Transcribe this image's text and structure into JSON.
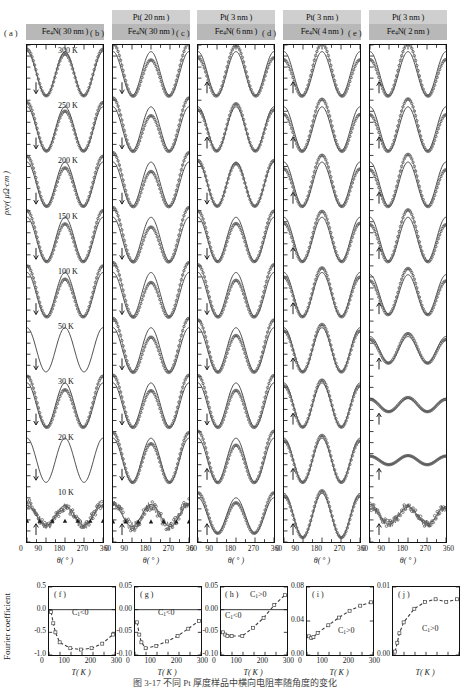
{
  "figure": {
    "caption": "图 3-17   不同 Pt 厚度样品中横向电阻率随角度的变化",
    "y_axis_main": "ρxy( μΩ·cm )",
    "y_axis_bottom": "Fourier coefficient",
    "x_axis_main": "θ( ° )",
    "x_axis_bottom": "T( K )"
  },
  "top_panels": [
    {
      "letter": "( a )",
      "pt_layer": "",
      "fe_layer": "Fe4N( 30 nm )",
      "xticks": [
        "0",
        "90",
        "180",
        "270",
        "360"
      ],
      "arrows": [
        "down",
        "down",
        "down",
        "down",
        "down",
        "down",
        "down",
        "down",
        "up"
      ]
    },
    {
      "letter": "( b )",
      "pt_layer": "Pt( 20 nm )",
      "fe_layer": "Fe4N( 30 nm )",
      "xticks": [
        "0",
        "90",
        "180",
        "270",
        "360"
      ],
      "arrows": [
        "down",
        "down",
        "down",
        "down",
        "down",
        "down",
        "down",
        "down",
        "up"
      ]
    },
    {
      "letter": "( c )",
      "pt_layer": "Pt( 3 nm )",
      "fe_layer": "Fe4N( 6 nm )",
      "xticks": [
        "0",
        "90",
        "180",
        "270",
        "360"
      ],
      "arrows": [
        "up",
        "up",
        "down",
        "down",
        "down",
        "down",
        "down",
        "up",
        "up"
      ]
    },
    {
      "letter": "( d )",
      "pt_layer": "Pt( 3 nm )",
      "fe_layer": "Fe4N( 4 nm )",
      "xticks": [
        "0",
        "90",
        "180",
        "270",
        "360"
      ],
      "arrows": [
        "up",
        "up",
        "up",
        "up",
        "up",
        "up",
        "up",
        "up",
        "up"
      ]
    },
    {
      "letter": "( e )",
      "pt_layer": "Pt( 3 nm )",
      "fe_layer": "Fe4N( 2 nm )",
      "xticks": [
        "0",
        "90",
        "180",
        "270",
        "360"
      ],
      "arrows": [
        "up",
        "up",
        "up",
        "up",
        "up",
        "up",
        "up",
        "up",
        "up"
      ]
    }
  ],
  "temperatures": [
    "300 K",
    "250 K",
    "200 K",
    "150 K",
    "100 K",
    "50 K",
    "30 K",
    "20 K",
    "10 K"
  ],
  "bottom_panels": [
    {
      "letter": "( f )",
      "sign_labels": [
        "C1<0"
      ],
      "yticks": [
        "0.5",
        "0.0",
        "-0.5",
        "-1.0"
      ],
      "xticks": [
        "0",
        "100",
        "200",
        "300"
      ]
    },
    {
      "letter": "( g )",
      "sign_labels": [
        "C1<0"
      ],
      "yticks": [
        "0.05",
        "0.00",
        "-0.05",
        "-0.10"
      ],
      "xticks": [
        "0",
        "100",
        "200",
        "300"
      ]
    },
    {
      "letter": "( h )",
      "sign_labels": [
        "C1>0",
        "C1<0"
      ],
      "yticks": [
        "0.05",
        "0.00",
        "-0.05",
        "-0.10"
      ],
      "xticks": [
        "0",
        "100",
        "200",
        "300"
      ]
    },
    {
      "letter": "( i )",
      "sign_labels": [
        "C1>0"
      ],
      "yticks": [
        "0.08",
        "0.04",
        "0.00"
      ],
      "xticks": [
        "0",
        "100",
        "200",
        "300"
      ]
    },
    {
      "letter": "( j )",
      "sign_labels": [
        "C1>0"
      ],
      "yticks": [
        "0.01",
        "0.00"
      ],
      "xticks": [
        "",
        "",
        "",
        ""
      ]
    }
  ],
  "chart_data": {
    "type": "line",
    "xlabel": "θ( ° )",
    "ylabel": "ρxy( μΩ·cm )",
    "xlim": [
      0,
      360
    ],
    "grid": false,
    "legend": "none",
    "panels": [
      {
        "id": "a",
        "stack": "Fe4N( 30 nm )",
        "curves": [
          {
            "T": "300 K",
            "amp": 1.0,
            "phase": 0,
            "c1": -0.3,
            "style": "open-circles+line"
          },
          {
            "T": "250 K",
            "amp": 1.0,
            "phase": 0,
            "c1": -0.55,
            "style": "open-circles+line"
          },
          {
            "T": "200 K",
            "amp": 1.0,
            "phase": 0,
            "c1": -0.75,
            "style": "open-circles+line"
          },
          {
            "T": "150 K",
            "amp": 1.0,
            "phase": 0,
            "c1": -0.85,
            "style": "open-circles+line"
          },
          {
            "T": "100 K",
            "amp": 1.0,
            "phase": 0,
            "c1": -0.85,
            "style": "open-circles+line"
          },
          {
            "T": "50 K",
            "amp": 1.0,
            "phase": 0,
            "c1": -0.88,
            "style": "line"
          },
          {
            "T": "30 K",
            "amp": 1.0,
            "phase": 0,
            "c1": -0.88,
            "style": "open-circles+line"
          },
          {
            "T": "20 K",
            "amp": 1.0,
            "phase": 0,
            "c1": -0.85,
            "style": "line"
          },
          {
            "T": "10 K",
            "amp": 0.45,
            "phase": 0,
            "c1": -0.6,
            "style": "triangles+circles"
          }
        ]
      },
      {
        "id": "b",
        "stack": "Pt( 20 nm ) / Fe4N( 30 nm )",
        "curves": [
          {
            "T": "300 K",
            "amp": 1.0,
            "phase": 0,
            "c1": -0.075,
            "style": "open-circles+line"
          },
          {
            "T": "250 K",
            "amp": 1.0,
            "phase": 0,
            "c1": -0.08,
            "style": "open-circles+line"
          },
          {
            "T": "200 K",
            "amp": 1.0,
            "phase": 0,
            "c1": -0.085,
            "style": "open-circles+line"
          },
          {
            "T": "150 K",
            "amp": 1.0,
            "phase": 0,
            "c1": -0.088,
            "style": "open-circles+line"
          },
          {
            "T": "100 K",
            "amp": 1.0,
            "phase": 0,
            "c1": -0.09,
            "style": "open-circles+line"
          },
          {
            "T": "50 K",
            "amp": 1.0,
            "phase": 0,
            "c1": -0.085,
            "style": "open-circles+line"
          },
          {
            "T": "30 K",
            "amp": 1.0,
            "phase": 0,
            "c1": -0.07,
            "style": "open-circles+line"
          },
          {
            "T": "20 K",
            "amp": 1.0,
            "phase": 0,
            "c1": -0.05,
            "style": "open-circles+line"
          },
          {
            "T": "10 K",
            "amp": 0.5,
            "phase": 0,
            "c1": -0.03,
            "style": "triangles+circles"
          }
        ]
      },
      {
        "id": "c",
        "stack": "Pt( 3 nm ) / Fe4N( 6 nm )",
        "curves": [
          {
            "T": "300 K",
            "amp": 1.0,
            "phase": 0,
            "c1": 0.04,
            "style": "open-circles+line"
          },
          {
            "T": "250 K",
            "amp": 1.0,
            "phase": 0,
            "c1": 0.02,
            "style": "open-circles+line"
          },
          {
            "T": "200 K",
            "amp": 1.0,
            "phase": 0,
            "c1": -0.01,
            "style": "open-circles+line"
          },
          {
            "T": "150 K",
            "amp": 1.0,
            "phase": 0,
            "c1": -0.04,
            "style": "open-circles+line"
          },
          {
            "T": "100 K",
            "amp": 1.0,
            "phase": 0,
            "c1": -0.05,
            "style": "open-circles+line"
          },
          {
            "T": "50 K",
            "amp": 1.0,
            "phase": 0,
            "c1": -0.05,
            "style": "open-circles+line"
          },
          {
            "T": "30 K",
            "amp": 1.0,
            "phase": 0,
            "c1": -0.048,
            "style": "open-circles+line"
          },
          {
            "T": "20 K",
            "amp": 1.0,
            "phase": 0,
            "c1": -0.045,
            "style": "open-circles+line"
          },
          {
            "T": "10 K",
            "amp": 0.8,
            "phase": 0,
            "c1": -0.04,
            "style": "open-circles+line"
          }
        ]
      },
      {
        "id": "d",
        "stack": "Pt( 3 nm ) / Fe4N( 4 nm )",
        "curves": [
          {
            "T": "300 K",
            "amp": 1.0,
            "phase": 0,
            "c1": 0.062,
            "style": "open-circles+line"
          },
          {
            "T": "250 K",
            "amp": 1.0,
            "phase": 0,
            "c1": 0.058,
            "style": "open-circles+line"
          },
          {
            "T": "200 K",
            "amp": 1.0,
            "phase": 0,
            "c1": 0.052,
            "style": "open-circles+line"
          },
          {
            "T": "150 K",
            "amp": 1.0,
            "phase": 0,
            "c1": 0.045,
            "style": "open-circles+line"
          },
          {
            "T": "100 K",
            "amp": 1.0,
            "phase": 0,
            "c1": 0.035,
            "style": "open-circles+line"
          },
          {
            "T": "50 K",
            "amp": 1.0,
            "phase": 0,
            "c1": 0.025,
            "style": "open-circles+line"
          },
          {
            "T": "30 K",
            "amp": 1.0,
            "phase": 0,
            "c1": 0.022,
            "style": "open-circles+line"
          },
          {
            "T": "20 K",
            "amp": 1.0,
            "phase": 0,
            "c1": 0.021,
            "style": "open-circles+line"
          },
          {
            "T": "10 K",
            "amp": 1.0,
            "phase": 0,
            "c1": 0.02,
            "style": "open-circles+line"
          }
        ]
      },
      {
        "id": "e",
        "stack": "Pt( 3 nm ) / Fe4N( 2 nm )",
        "curves": [
          {
            "T": "300 K",
            "amp": 1.0,
            "phase": 0,
            "c1": 0.008,
            "style": "open-circles+line"
          },
          {
            "T": "250 K",
            "amp": 1.0,
            "phase": 0,
            "c1": 0.008,
            "style": "open-circles+line"
          },
          {
            "T": "200 K",
            "amp": 1.0,
            "phase": 0,
            "c1": 0.0078,
            "style": "open-circles+line"
          },
          {
            "T": "150 K",
            "amp": 1.0,
            "phase": 0,
            "c1": 0.0075,
            "style": "open-circles+line"
          },
          {
            "T": "100 K",
            "amp": 0.9,
            "phase": 0,
            "c1": 0.007,
            "style": "open-circles+line"
          },
          {
            "T": "50 K",
            "amp": 0.6,
            "phase": 0,
            "c1": 0.005,
            "style": "open-circles+line"
          },
          {
            "T": "30 K",
            "amp": 0.3,
            "phase": 0,
            "c1": 0.003,
            "style": "open-circles+line"
          },
          {
            "T": "20 K",
            "amp": 0.2,
            "phase": 0,
            "c1": 0.0015,
            "style": "open-circles+line"
          },
          {
            "T": "10 K",
            "amp": 0.4,
            "phase": 0,
            "c1": 0.0005,
            "style": "noisy"
          }
        ]
      }
    ],
    "fourier_panels": [
      {
        "id": "f",
        "xlabel": "T( K )",
        "ylabel": "Fourier coefficient",
        "xlim": [
          0,
          310
        ],
        "ylim": [
          -1.0,
          0.5
        ],
        "x": [
          10,
          20,
          30,
          50,
          100,
          150,
          200,
          250,
          300
        ],
        "y": [
          -0.05,
          -0.3,
          -0.5,
          -0.72,
          -0.85,
          -0.88,
          -0.85,
          -0.75,
          -0.55
        ]
      },
      {
        "id": "g",
        "xlabel": "T( K )",
        "xlim": [
          0,
          310
        ],
        "ylim": [
          -0.1,
          0.05
        ],
        "x": [
          10,
          20,
          30,
          50,
          100,
          150,
          200,
          250,
          300
        ],
        "y": [
          -0.028,
          -0.055,
          -0.072,
          -0.085,
          -0.08,
          -0.07,
          -0.058,
          -0.042,
          -0.025
        ]
      },
      {
        "id": "h",
        "xlabel": "T( K )",
        "xlim": [
          0,
          310
        ],
        "ylim": [
          -0.1,
          0.05
        ],
        "x": [
          10,
          20,
          30,
          50,
          100,
          150,
          200,
          250,
          300
        ],
        "y": [
          -0.05,
          -0.055,
          -0.058,
          -0.058,
          -0.058,
          -0.04,
          -0.018,
          0.01,
          0.032
        ]
      },
      {
        "id": "i",
        "xlabel": "T( K )",
        "xlim": [
          0,
          310
        ],
        "ylim": [
          0.0,
          0.08
        ],
        "x": [
          10,
          20,
          30,
          50,
          100,
          150,
          200,
          250,
          300
        ],
        "y": [
          0.022,
          0.02,
          0.021,
          0.026,
          0.035,
          0.044,
          0.052,
          0.058,
          0.062
        ]
      },
      {
        "id": "j",
        "xlabel": "T( K )",
        "xlim": [
          0,
          310
        ],
        "ylim": [
          0.0,
          0.01
        ],
        "x": [
          10,
          20,
          30,
          50,
          100,
          150,
          200,
          250,
          300
        ],
        "y": [
          0.0005,
          0.0018,
          0.0032,
          0.0048,
          0.0068,
          0.0078,
          0.0082,
          0.0078,
          0.0082
        ]
      }
    ]
  }
}
